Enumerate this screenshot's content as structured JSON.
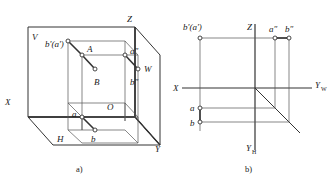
{
  "figure": {
    "caption_a": "a)",
    "caption_b": "b)"
  },
  "pictorial": {
    "planes": {
      "v_label": "V",
      "h_label": "H",
      "w_label": "W"
    },
    "axes": {
      "z": "Z",
      "x": "X",
      "y": "Y"
    },
    "origin": "O",
    "points": {
      "a_prime_b_prime": "b'(a')",
      "A": "A",
      "B": "B",
      "a_double_prime": "a″",
      "b_double_prime": "b″",
      "a": "a",
      "b": "b"
    }
  },
  "projection": {
    "axes": {
      "z": "Z",
      "x": "X",
      "y_w": "Y",
      "y_w_sub": "W",
      "y_h": "Y",
      "y_h_sub": "H"
    },
    "points": {
      "front_view": "b'(a')",
      "side_a": "a″",
      "side_b": "b″",
      "top_a": "a",
      "top_b": "b"
    }
  },
  "colors": {
    "line": "#333333",
    "thin_line": "#555555",
    "text": "#1a1a1a",
    "background": "#ffffff"
  }
}
